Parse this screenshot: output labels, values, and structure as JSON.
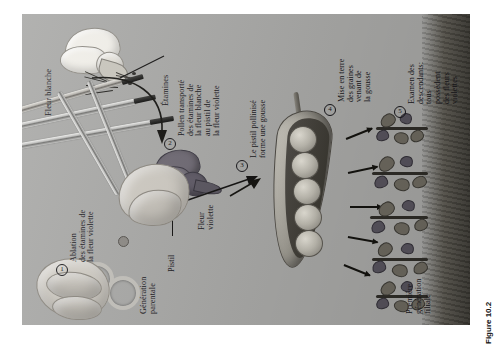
{
  "figure": {
    "caption": "Figure 10.2",
    "panel_background": "#a9a9a7",
    "text_color": "#17161a",
    "orientation": "rotated-90-ccw"
  },
  "labels": {
    "white_flower": "Fleur blanche",
    "stamens": "Étamines",
    "violet_flower": "Fleur\nviolette",
    "pistil": "Pistil",
    "parental_generation": "Génération\nparentale",
    "first_filial_generation": "Première\ngénération\nfiliale"
  },
  "steps": [
    {
      "number": "1",
      "text": "Ablation\ndes étamines de\nla fleur violette"
    },
    {
      "number": "2",
      "text": "Pollen transporté\ndes étamines de\nla fleur blanche\nau pistil de\nla fleur violette"
    },
    {
      "number": "3",
      "text": "Le pistil pollinisé\nforme une gousse"
    },
    {
      "number": "4",
      "text": "Mise en terre\ndes graines\nvenant de\nla gousse"
    },
    {
      "number": "5",
      "text": "Examen des\ndescendants:\ntous\npossèdent\ndes fleurs\nviolettes"
    }
  ],
  "artwork": {
    "pea_count": 5,
    "seedling_count": 5,
    "arrow_count": 5,
    "tool": "forceps",
    "pollen_brush": "paintbrush"
  }
}
